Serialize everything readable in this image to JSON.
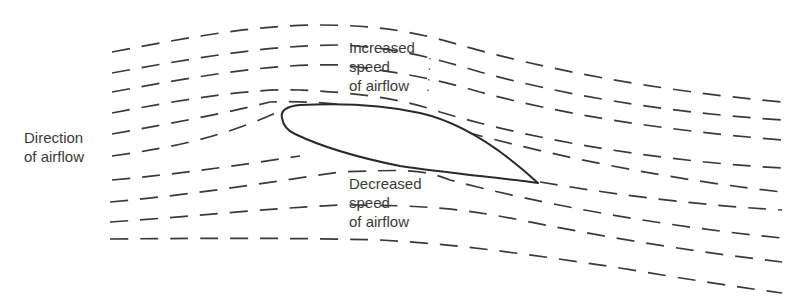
{
  "diagram": {
    "labels": {
      "direction": {
        "line1": "Direction",
        "line2": "of airflow"
      },
      "increased": {
        "line1": "Increased",
        "line2": "speed",
        "line3": "of airflow"
      },
      "decreased": {
        "line1": "Decreased",
        "line2": "speed",
        "line3": "of airflow"
      }
    },
    "colors": {
      "stroke": "#3a3a3a",
      "background": "#ffffff",
      "text": "#3a3a3a"
    },
    "streamline_count": 10,
    "elements": {
      "airfoil": "airfoil cross-section",
      "streamlines": "dashed flow streamlines"
    }
  }
}
